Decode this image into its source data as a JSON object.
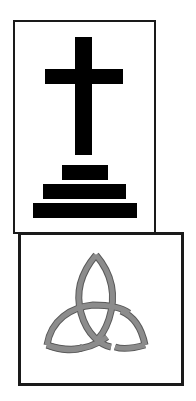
{
  "panels": [
    {
      "name": "cross-panel",
      "symbol": "calvary-cross-icon",
      "description": "Black Latin cross on three-step base",
      "colors": {
        "symbol": "#000000",
        "border": "#1a1a1a",
        "background": "#ffffff"
      }
    },
    {
      "name": "triquetra-panel",
      "symbol": "triquetra-icon",
      "description": "Gray interlaced triquetra knot",
      "colors": {
        "symbol": "#8c8c8c",
        "outline": "#555555",
        "border": "#1a1a1a",
        "background": "#ffffff"
      }
    }
  ]
}
